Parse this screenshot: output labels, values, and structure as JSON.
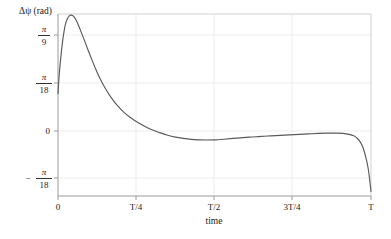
{
  "chart_data": {
    "type": "line",
    "title": "",
    "ylabel": "Δψ (rad)",
    "xlabel": "time",
    "x_tick_labels": [
      "0",
      "T/4",
      "T/2",
      "3T/4",
      "T"
    ],
    "x_tick_values": [
      0,
      0.25,
      0.5,
      0.75,
      1.0
    ],
    "y_tick_labels": [
      "π/9",
      "π/18",
      "0",
      "−π/18"
    ],
    "y_tick_values": [
      0.3491,
      0.1745,
      0,
      -0.1745
    ],
    "xlim": [
      0,
      1.0
    ],
    "ylim": [
      -0.1745,
      0.3927
    ],
    "grid": true,
    "legend": null,
    "series": [
      {
        "name": "delta-psi",
        "color": "#5a5a5a",
        "x": [
          0.0,
          0.004,
          0.009,
          0.014,
          0.019,
          0.024,
          0.03,
          0.036,
          0.043,
          0.05,
          0.058,
          0.066,
          0.075,
          0.085,
          0.095,
          0.105,
          0.12,
          0.135,
          0.15,
          0.17,
          0.19,
          0.21,
          0.23,
          0.25,
          0.275,
          0.3,
          0.325,
          0.35,
          0.375,
          0.4,
          0.425,
          0.45,
          0.475,
          0.5,
          0.53,
          0.56,
          0.59,
          0.62,
          0.65,
          0.68,
          0.71,
          0.74,
          0.77,
          0.8,
          0.83,
          0.86,
          0.89,
          0.91,
          0.93,
          0.945,
          0.955,
          0.965,
          0.975,
          0.985,
          0.992,
          1.0
        ],
        "y": [
          0.145,
          0.205,
          0.258,
          0.302,
          0.336,
          0.362,
          0.378,
          0.387,
          0.389,
          0.385,
          0.373,
          0.356,
          0.334,
          0.309,
          0.283,
          0.258,
          0.222,
          0.19,
          0.163,
          0.132,
          0.107,
          0.087,
          0.071,
          0.058,
          0.044,
          0.032,
          0.023,
          0.015,
          0.009,
          0.005,
          0.002,
          0.0005,
          0.0,
          0.0005,
          0.0025,
          0.005,
          0.0075,
          0.0095,
          0.0115,
          0.013,
          0.0145,
          0.016,
          0.0175,
          0.019,
          0.0205,
          0.0215,
          0.0215,
          0.0205,
          0.0175,
          0.013,
          0.006,
          -0.005,
          -0.025,
          -0.06,
          -0.095,
          -0.16
        ]
      }
    ]
  }
}
